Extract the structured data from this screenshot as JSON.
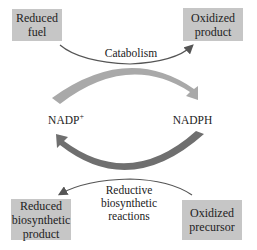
{
  "boxes": {
    "reduced_fuel": {
      "line1": "Reduced",
      "line2": "fuel"
    },
    "oxidized_product": {
      "line1": "Oxidized",
      "line2": "product"
    },
    "reduced_biosynthetic_product": {
      "line1": "Reduced",
      "line2": "biosynthetic",
      "line3": "product"
    },
    "oxidized_precursor": {
      "line1": "Oxidized",
      "line2": "precursor"
    }
  },
  "labels": {
    "catabolism": "Catabolism",
    "nadp_plus": "NADP",
    "nadp_plus_sup": "+",
    "nadph": "NADPH",
    "reductive_line1": "Reductive",
    "reductive_line2": "biosynthetic",
    "reductive_line3": "reactions"
  },
  "colors": {
    "box_fill": "#c6c6c6",
    "top_arc": "#a9a9a9",
    "bottom_arc": "#6f6f6f",
    "thin_arrow": "#555555"
  }
}
